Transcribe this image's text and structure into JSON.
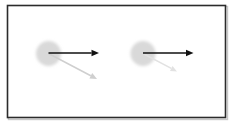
{
  "figure": {
    "background_color": "#ffffff",
    "frame": {
      "name": "diagram-border",
      "x": 7,
      "y": 5,
      "width": 219,
      "height": 113,
      "stroke_color": "#2b2b2b",
      "stroke_width": 1.6,
      "fill_color": "#ffffff",
      "shadow_color": "#c8c8c8"
    },
    "groups": [
      {
        "id": "left-group",
        "label": "Left particle with vectors",
        "particle": {
          "name": "particle-circle-left",
          "cx": 48.5,
          "cy": 53.5,
          "r": 12.5,
          "fill_color": "#d9d9d9",
          "blur": 1.6
        },
        "vectors": [
          {
            "name": "velocity-vector-left",
            "kind": "primary",
            "x1": 48.5,
            "y1": 53.0,
            "x2": 99.0,
            "y2": 53.0,
            "color": "#111111",
            "width": 1.7,
            "head_length": 7.5,
            "head_width": 6.5,
            "length_px": 50.5,
            "angle_deg": 0
          },
          {
            "name": "secondary-vector-left",
            "kind": "secondary",
            "x1": 48.5,
            "y1": 53.5,
            "x2": 97.0,
            "y2": 79.0,
            "color": "#cfcfcf",
            "width": 1.5,
            "head_length": 7.0,
            "head_width": 6.0,
            "length_px": 54.8,
            "angle_deg": 27.7
          }
        ]
      },
      {
        "id": "right-group",
        "label": "Right particle with vectors",
        "particle": {
          "name": "particle-circle-right",
          "cx": 143.0,
          "cy": 53.5,
          "r": 12.5,
          "fill_color": "#d9d9d9",
          "blur": 1.6
        },
        "vectors": [
          {
            "name": "velocity-vector-right",
            "kind": "primary",
            "x1": 143.0,
            "y1": 53.0,
            "x2": 193.5,
            "y2": 53.0,
            "color": "#111111",
            "width": 1.7,
            "head_length": 7.5,
            "head_width": 6.5,
            "length_px": 50.5,
            "angle_deg": 0
          },
          {
            "name": "secondary-vector-right",
            "kind": "secondary",
            "x1": 143.0,
            "y1": 53.5,
            "x2": 177.0,
            "y2": 71.5,
            "color": "#e2e2e2",
            "width": 1.5,
            "head_length": 6.5,
            "head_width": 5.5,
            "length_px": 38.5,
            "angle_deg": 27.9
          }
        ]
      }
    ]
  },
  "chart_data": {
    "type": "scatter",
    "xlabel": "",
    "ylabel": "",
    "grid": false,
    "legend": "none",
    "series": [
      {
        "name": "particles",
        "points": [
          {
            "label": "left-particle",
            "x": 48.5,
            "y": 53.5,
            "radius": 12.5
          },
          {
            "label": "right-particle",
            "x": 143.0,
            "y": 53.5,
            "radius": 12.5
          }
        ]
      },
      {
        "name": "primary-vectors",
        "values": [
          50.5,
          50.5
        ],
        "angles_deg": [
          0,
          0
        ],
        "color": "#111111"
      },
      {
        "name": "secondary-vectors",
        "values": [
          54.8,
          38.5
        ],
        "angles_deg": [
          27.7,
          27.9
        ],
        "color": "#d4d4d4"
      }
    ]
  }
}
